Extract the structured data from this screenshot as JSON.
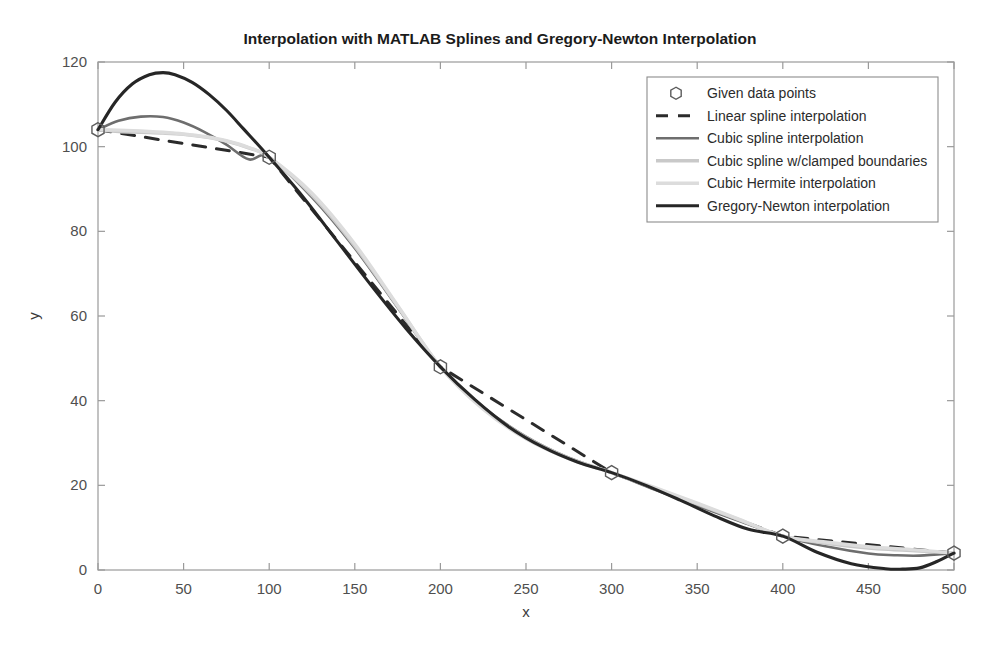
{
  "chart_data": {
    "type": "line",
    "title": "Interpolation with MATLAB Splines and Gregory-Newton Interpolation",
    "xlabel": "x",
    "ylabel": "y",
    "xlim": [
      0,
      500
    ],
    "ylim": [
      0,
      120
    ],
    "xticks": [
      0,
      50,
      100,
      150,
      200,
      250,
      300,
      350,
      400,
      450,
      500
    ],
    "yticks": [
      0,
      20,
      40,
      60,
      80,
      100,
      120
    ],
    "grid": false,
    "legend_position": "top-right",
    "data_points": {
      "x": [
        0,
        100,
        200,
        300,
        400,
        500
      ],
      "y": [
        104,
        97.5,
        48,
        23,
        8,
        4
      ]
    },
    "series": [
      {
        "name": "Given data points",
        "style": "marker",
        "marker": "hexagon-open",
        "color": "#5c5c5c",
        "x": [
          0,
          100,
          200,
          300,
          400,
          500
        ],
        "y": [
          104,
          97.5,
          48,
          23,
          8,
          4
        ]
      },
      {
        "name": "Linear spline interpolation",
        "style": "dashed",
        "color": "#2b2b2b",
        "width": 3.0,
        "x": [
          0,
          100,
          200,
          300,
          400,
          500
        ],
        "y": [
          104,
          97.5,
          48,
          23,
          8,
          4
        ]
      },
      {
        "name": "Cubic spline interpolation",
        "style": "solid",
        "color": "#6e6e6e",
        "width": 2.6,
        "x": [
          0,
          12,
          25,
          38,
          50,
          62,
          75,
          88,
          100,
          125,
          150,
          175,
          200,
          225,
          250,
          275,
          300,
          325,
          350,
          375,
          400,
          425,
          450,
          465,
          480,
          500
        ],
        "y": [
          104,
          106.1,
          107.1,
          107.0,
          105.7,
          103.5,
          100.5,
          97.0,
          97.5,
          88.0,
          76.0,
          62.0,
          48.0,
          38.5,
          31.5,
          26.5,
          23.0,
          19.0,
          15.2,
          11.5,
          8.0,
          5.6,
          3.9,
          3.5,
          3.4,
          4.0
        ]
      },
      {
        "name": "Cubic spline w/clamped boundaries",
        "style": "solid",
        "color": "#c9c9c9",
        "width": 3.4,
        "x": [
          0,
          12,
          25,
          38,
          50,
          62,
          75,
          88,
          100,
          125,
          150,
          175,
          200,
          225,
          250,
          275,
          300,
          325,
          350,
          375,
          400,
          425,
          450,
          465,
          480,
          500
        ],
        "y": [
          104,
          103.6,
          103.4,
          103.2,
          102.9,
          102.3,
          101.3,
          99.7,
          97.5,
          88.5,
          76.5,
          62.3,
          48.0,
          38.2,
          31.3,
          26.4,
          23.0,
          19.3,
          15.6,
          11.8,
          8.0,
          6.3,
          5.2,
          4.8,
          4.5,
          4.0
        ]
      },
      {
        "name": "Cubic Hermite interpolation",
        "style": "solid",
        "color": "#dcdcdc",
        "width": 3.4,
        "x": [
          0,
          12,
          25,
          38,
          50,
          62,
          75,
          88,
          100,
          125,
          150,
          175,
          200,
          225,
          250,
          275,
          300,
          325,
          350,
          375,
          400,
          425,
          450,
          465,
          480,
          500
        ],
        "y": [
          104,
          103.9,
          103.7,
          103.4,
          103.0,
          102.4,
          101.4,
          99.8,
          97.5,
          89.0,
          77.0,
          62.5,
          48.0,
          38.0,
          31.0,
          26.3,
          23.0,
          19.5,
          15.8,
          11.9,
          8.0,
          6.6,
          5.5,
          5.1,
          4.7,
          4.0
        ]
      },
      {
        "name": "Gregory-Newton interpolation",
        "style": "solid",
        "color": "#262626",
        "width": 3.1,
        "x": [
          0,
          10,
          20,
          30,
          38,
          45,
          55,
          65,
          75,
          85,
          100,
          120,
          140,
          160,
          180,
          200,
          220,
          240,
          260,
          280,
          300,
          320,
          340,
          360,
          380,
          400,
          420,
          440,
          460,
          470,
          480,
          490,
          500
        ],
        "y": [
          104,
          110.5,
          114.8,
          117.0,
          117.5,
          117.0,
          115.2,
          112.3,
          108.6,
          104.2,
          97.5,
          88.0,
          77.5,
          67.0,
          57.0,
          48.0,
          40.3,
          33.8,
          29.0,
          25.5,
          23.0,
          20.0,
          16.5,
          12.8,
          9.6,
          8.0,
          4.2,
          1.5,
          0.3,
          0.2,
          0.5,
          2.0,
          4.0
        ]
      }
    ]
  },
  "legend": {
    "items": [
      {
        "label": "Given data points",
        "type": "marker"
      },
      {
        "label": "Linear spline interpolation",
        "type": "dashed"
      },
      {
        "label": "Cubic spline interpolation",
        "type": "solid"
      },
      {
        "label": "Cubic spline w/clamped boundaries",
        "type": "solid"
      },
      {
        "label": "Cubic Hermite interpolation",
        "type": "solid"
      },
      {
        "label": "Gregory-Newton interpolation",
        "type": "solid"
      }
    ]
  }
}
